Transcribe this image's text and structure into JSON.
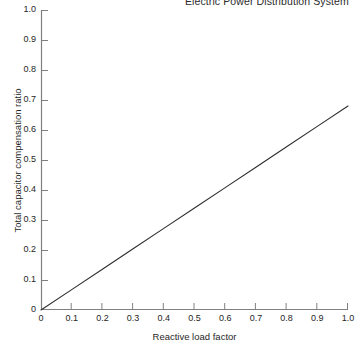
{
  "chart_data": {
    "type": "line",
    "title": "Electric Power Distribution System",
    "xlabel": "Reactive load factor",
    "ylabel": "Total capacitor compensation ratio",
    "xlim": [
      0,
      1.0
    ],
    "ylim": [
      0,
      1.0
    ],
    "grid": false,
    "legend": "none",
    "xticks": [
      "0",
      "0.1",
      "0.2",
      "0.3",
      "0.4",
      "0.5",
      "0.6",
      "0.7",
      "0.8",
      "0.9",
      "1.0"
    ],
    "xtick_values": [
      0,
      0.1,
      0.2,
      0.3,
      0.4,
      0.5,
      0.6,
      0.7,
      0.8,
      0.9,
      1.0
    ],
    "yticks": [
      "0",
      "0.1",
      "0.2",
      "0.3",
      "0.4",
      "0.5",
      "0.6",
      "0.7",
      "0.8",
      "0.9",
      "1.0"
    ],
    "ytick_values": [
      0,
      0.1,
      0.2,
      0.3,
      0.4,
      0.5,
      0.6,
      0.7,
      0.8,
      0.9,
      1.0
    ],
    "series": [
      {
        "name": "Total capacitor compensation ratio",
        "color": "#2e2e2e",
        "x": [
          0,
          0.1,
          0.2,
          0.3,
          0.4,
          0.5,
          0.6,
          0.7,
          0.8,
          0.9,
          1.0
        ],
        "values": [
          0.0,
          0.068,
          0.136,
          0.204,
          0.272,
          0.34,
          0.408,
          0.476,
          0.544,
          0.612,
          0.68
        ]
      }
    ],
    "colors": {
      "axis": "#808080",
      "tick": "#808080",
      "line": "#2e2e2e",
      "text": "#1f1f1f",
      "background": "#ffffff"
    }
  }
}
